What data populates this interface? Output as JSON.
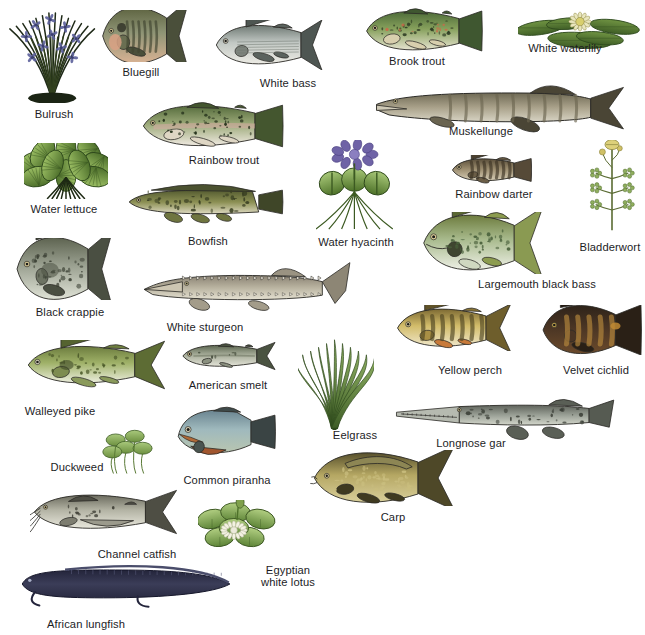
{
  "plate": {
    "title": "Freshwater fishes and aquatic plants",
    "background_color": "#ffffff",
    "label_color": "#1d1d1f",
    "width": 645,
    "height": 635
  },
  "organisms": [
    {
      "id": "bulrush",
      "label": "Bulrush",
      "kind": "plant",
      "art": "bulrush",
      "x": 8,
      "y": 8,
      "w": 92,
      "h": 95,
      "lx": 54,
      "ly": 108
    },
    {
      "id": "bluegill",
      "label": "Bluegill",
      "kind": "fish",
      "art": "bluegill",
      "x": 100,
      "y": 10,
      "w": 90,
      "h": 52,
      "lx": 141,
      "ly": 66
    },
    {
      "id": "white-bass",
      "label": "White bass",
      "kind": "fish",
      "art": "whitebass",
      "x": 213,
      "y": 20,
      "w": 110,
      "h": 50,
      "lx": 288,
      "ly": 77
    },
    {
      "id": "brook-trout",
      "label": "Brook trout",
      "kind": "fish",
      "art": "brooktrout",
      "x": 363,
      "y": 6,
      "w": 120,
      "h": 50,
      "lx": 417,
      "ly": 55
    },
    {
      "id": "white-waterlily",
      "label": "White waterlily",
      "kind": "plant",
      "art": "waterlily",
      "x": 518,
      "y": 6,
      "w": 124,
      "h": 52,
      "lx": 565,
      "ly": 42
    },
    {
      "id": "muskellunge",
      "label": "Muskellunge",
      "kind": "fish",
      "art": "muskellunge",
      "x": 374,
      "y": 78,
      "w": 252,
      "h": 58,
      "lx": 481,
      "ly": 125
    },
    {
      "id": "rainbow-trout",
      "label": "Rainbow trout",
      "kind": "fish",
      "art": "rainbowtrout",
      "x": 139,
      "y": 100,
      "w": 145,
      "h": 52,
      "lx": 224,
      "ly": 154
    },
    {
      "id": "water-lettuce",
      "label": "Water lettuce",
      "kind": "plant",
      "art": "waterlettuce",
      "x": 24,
      "y": 143,
      "w": 84,
      "h": 56,
      "lx": 64,
      "ly": 203
    },
    {
      "id": "water-hyacinth",
      "label": "Water hyacinth",
      "kind": "plant",
      "art": "waterhyacinth",
      "x": 316,
      "y": 140,
      "w": 80,
      "h": 90,
      "lx": 356,
      "ly": 236
    },
    {
      "id": "rainbow-darter",
      "label": "Rainbow darter",
      "kind": "fish",
      "art": "rainbowdarter",
      "x": 450,
      "y": 155,
      "w": 82,
      "h": 30,
      "lx": 494,
      "ly": 188
    },
    {
      "id": "bladderwort",
      "label": "Bladderwort",
      "kind": "plant",
      "art": "bladderwort",
      "x": 588,
      "y": 140,
      "w": 48,
      "h": 92,
      "lx": 610,
      "ly": 241
    },
    {
      "id": "bowfish",
      "label": "Bowfish",
      "kind": "fish",
      "art": "bowfish",
      "x": 126,
      "y": 178,
      "w": 158,
      "h": 48,
      "lx": 208,
      "ly": 235
    },
    {
      "id": "largemouth-bass",
      "label": "Largemouth black bass",
      "kind": "fish",
      "art": "largemouth",
      "x": 420,
      "y": 212,
      "w": 124,
      "h": 62,
      "lx": 537,
      "ly": 278
    },
    {
      "id": "black-crappie",
      "label": "Black crappie",
      "kind": "fish",
      "art": "blackcrappie",
      "x": 14,
      "y": 238,
      "w": 100,
      "h": 62,
      "lx": 70,
      "ly": 306
    },
    {
      "id": "white-sturgeon",
      "label": "White sturgeon",
      "kind": "fish",
      "art": "sturgeon",
      "x": 140,
      "y": 258,
      "w": 212,
      "h": 58,
      "lx": 205,
      "ly": 321
    },
    {
      "id": "yellow-perch",
      "label": "Yellow perch",
      "kind": "fish",
      "art": "yellowperch",
      "x": 394,
      "y": 305,
      "w": 118,
      "h": 46,
      "lx": 470,
      "ly": 364
    },
    {
      "id": "velvet-cichlid",
      "label": "Velvet cichlid",
      "kind": "fish",
      "art": "velvetcichlid",
      "x": 540,
      "y": 305,
      "w": 102,
      "h": 50,
      "lx": 596,
      "ly": 364
    },
    {
      "id": "walleyed-pike",
      "label": "Walleyed pike",
      "kind": "fish",
      "art": "walleye",
      "x": 24,
      "y": 340,
      "w": 142,
      "h": 50,
      "lx": 60,
      "ly": 405
    },
    {
      "id": "american-smelt",
      "label": "American smelt",
      "kind": "fish",
      "art": "smelt",
      "x": 180,
      "y": 340,
      "w": 96,
      "h": 32,
      "lx": 228,
      "ly": 379
    },
    {
      "id": "eelgrass",
      "label": "Eelgrass",
      "kind": "plant",
      "art": "eelgrass",
      "x": 298,
      "y": 336,
      "w": 76,
      "h": 94,
      "lx": 355,
      "ly": 429
    },
    {
      "id": "longnose-gar",
      "label": "Longnose gar",
      "kind": "fish",
      "art": "longnosegar",
      "x": 392,
      "y": 388,
      "w": 224,
      "h": 52,
      "lx": 471,
      "ly": 437
    },
    {
      "id": "duckweed",
      "label": "Duckweed",
      "kind": "plant",
      "art": "duckweed",
      "x": 100,
      "y": 428,
      "w": 56,
      "h": 46,
      "lx": 77,
      "ly": 461
    },
    {
      "id": "common-piranha",
      "label": "Common piranha",
      "kind": "fish",
      "art": "piranha",
      "x": 172,
      "y": 404,
      "w": 104,
      "h": 58,
      "lx": 227,
      "ly": 474
    },
    {
      "id": "carp",
      "label": "Carp",
      "kind": "fish",
      "art": "carp",
      "x": 310,
      "y": 450,
      "w": 146,
      "h": 56,
      "lx": 393,
      "ly": 511
    },
    {
      "id": "channel-catfish",
      "label": "Channel catfish",
      "kind": "fish",
      "art": "catfish",
      "x": 30,
      "y": 488,
      "w": 148,
      "h": 48,
      "lx": 137,
      "ly": 548
    },
    {
      "id": "egyptian-lotus",
      "label": "Egyptian\nwhite lotus",
      "kind": "plant",
      "art": "lotus",
      "x": 198,
      "y": 500,
      "w": 78,
      "h": 56,
      "lx": 288,
      "ly": 564
    },
    {
      "id": "african-lungfish",
      "label": "African lungfish",
      "kind": "fish",
      "art": "lungfish",
      "x": 18,
      "y": 558,
      "w": 214,
      "h": 52,
      "lx": 86,
      "ly": 618
    }
  ],
  "colors": {
    "plant_green_dark": "#4b6b33",
    "plant_green_mid": "#7fa04c",
    "plant_green_light": "#a9c277",
    "fish_olive": "#78803f",
    "fish_silver": "#c9ccc4",
    "fish_pale": "#e8e6dc",
    "fish_dark": "#3d3a30",
    "outline": "#2b2a26"
  }
}
